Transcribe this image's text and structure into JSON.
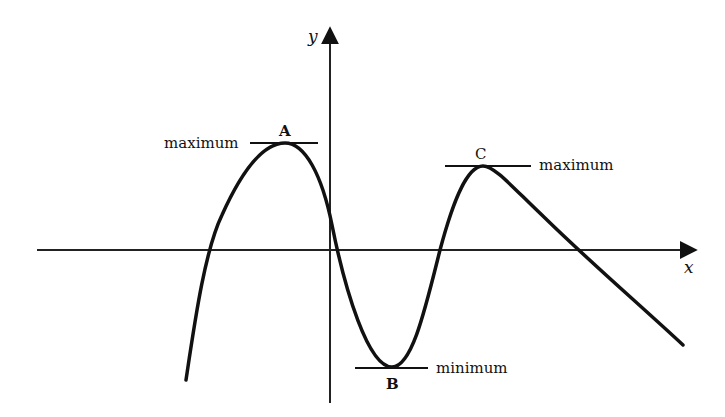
{
  "diagram": {
    "type": "function-graph",
    "axes": {
      "x_label": "x",
      "y_label": "y"
    },
    "points": [
      {
        "id": "A",
        "label": "A",
        "kind_label": "maximum",
        "kind": "local maximum"
      },
      {
        "id": "B",
        "label": "B",
        "kind_label": "minimum",
        "kind": "local minimum"
      },
      {
        "id": "C",
        "label": "C",
        "kind_label": "maximum",
        "kind": "local maximum"
      }
    ],
    "colors": {
      "ink": "#111111",
      "background": "#ffffff"
    }
  }
}
